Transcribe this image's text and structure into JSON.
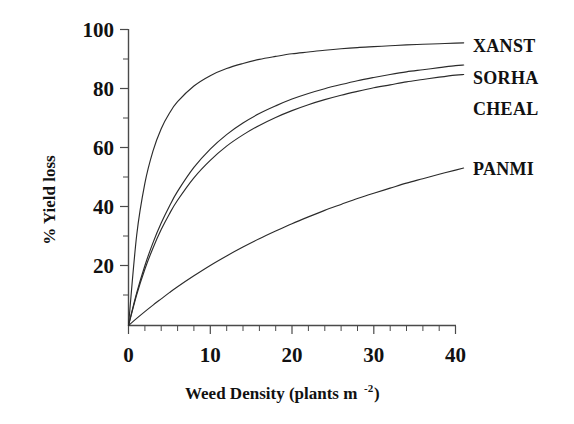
{
  "chart_data": {
    "type": "line",
    "title": "",
    "subtitle": "",
    "xlabel": "Weed Density (plants m",
    "xlabel_superscript": "-2",
    "xlabel_suffix": ")",
    "ylabel": "% Yield loss",
    "xlim": [
      0,
      40
    ],
    "ylim": [
      0,
      100
    ],
    "x_ticks": [
      0,
      10,
      20,
      30,
      40
    ],
    "x_tick_labels": [
      "0",
      "10",
      "20",
      "30",
      "40"
    ],
    "x_minor_tick_step": 2,
    "y_ticks": [
      0,
      20,
      40,
      60,
      80,
      100
    ],
    "y_tick_labels": [
      "0",
      "20",
      "40",
      "60",
      "80",
      "100"
    ],
    "y_minor_tick_step": 10,
    "grid": false,
    "legend_position": "right-inline-curve-ends",
    "x": [
      0,
      1,
      2,
      3,
      4,
      5,
      6,
      8,
      10,
      12,
      14,
      16,
      18,
      20,
      22,
      24,
      26,
      28,
      30,
      32,
      34,
      36,
      38,
      40,
      41
    ],
    "series": [
      {
        "name": "XANST",
        "label": "XANST",
        "color": "#2b2b2b",
        "label_y_value": 95,
        "values": [
          0,
          30.5,
          48.0,
          59.0,
          66.5,
          71.7,
          75.6,
          80.9,
          84.4,
          86.8,
          88.5,
          89.9,
          90.9,
          91.8,
          92.4,
          93.0,
          93.5,
          93.9,
          94.2,
          94.5,
          94.8,
          95.0,
          95.2,
          95.4,
          95.5
        ]
      },
      {
        "name": "SORHA",
        "label": "SORHA",
        "color": "#2b2b2b",
        "label_y_value": 83,
        "values": [
          0,
          11.0,
          20.2,
          28.0,
          34.6,
          40.3,
          45.3,
          53.4,
          59.6,
          64.5,
          68.4,
          71.6,
          74.2,
          76.5,
          78.4,
          80.0,
          81.4,
          82.7,
          83.8,
          84.8,
          85.7,
          86.4,
          87.1,
          87.8,
          88.0
        ]
      },
      {
        "name": "CHEAL",
        "label": "CHEAL",
        "color": "#2b2b2b",
        "label_y_value": 74,
        "values": [
          0,
          10.4,
          19.0,
          26.2,
          32.4,
          37.7,
          42.3,
          49.9,
          55.8,
          60.6,
          64.4,
          67.6,
          70.3,
          72.6,
          74.6,
          76.3,
          77.8,
          79.1,
          80.3,
          81.3,
          82.3,
          83.1,
          83.9,
          84.6,
          84.8
        ]
      },
      {
        "name": "PANMI",
        "label": "PANMI",
        "color": "#2b2b2b",
        "label_y_value": 53,
        "values": [
          0,
          2.4,
          4.7,
          6.9,
          9.0,
          11.1,
          13.1,
          16.8,
          20.3,
          23.5,
          26.5,
          29.3,
          31.9,
          34.4,
          36.7,
          38.9,
          40.9,
          42.9,
          44.7,
          46.4,
          48.1,
          49.6,
          51.1,
          52.5,
          53.2
        ]
      }
    ]
  },
  "labels": {
    "xanst": "XANST",
    "sorha": "SORHA",
    "cheal": "CHEAL",
    "panmi": "PANMI"
  },
  "axis": {
    "y_title": "% Yield loss",
    "x_title_main": "Weed Density (plants m",
    "x_title_sup": "-2",
    "x_title_end": ")",
    "x_tick_0": "0",
    "x_tick_10": "10",
    "x_tick_20": "20",
    "x_tick_30": "30",
    "x_tick_40": "40",
    "y_tick_20": "20",
    "y_tick_40": "40",
    "y_tick_60": "60",
    "y_tick_80": "80",
    "y_tick_100": "100"
  }
}
